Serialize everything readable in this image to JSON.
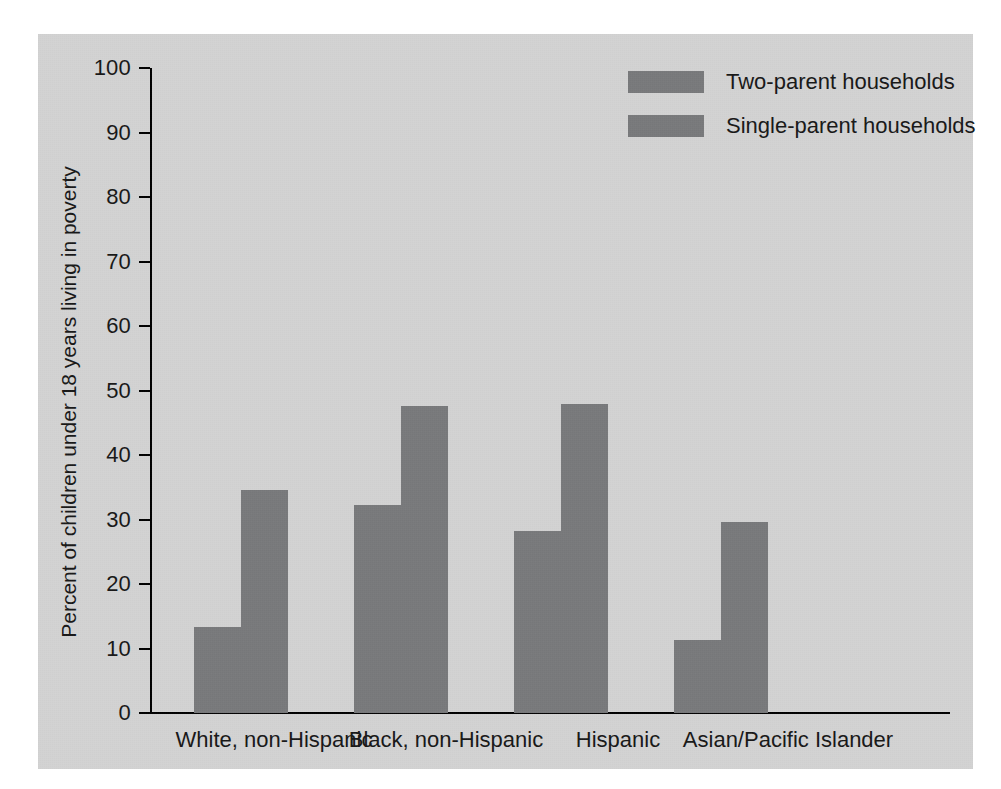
{
  "figure": {
    "background_color": "#d3d3d3",
    "bar_color": "#78797b",
    "axis_color": "#000000"
  },
  "axis": {
    "y_title": "Percent of children under 18 years living in poverty",
    "y_ticks": [
      "100",
      "90",
      "80",
      "70",
      "60",
      "50",
      "40",
      "30",
      "20",
      "10",
      "0"
    ]
  },
  "legend": {
    "items": [
      {
        "label": "Two-parent households",
        "color": "#78797b"
      },
      {
        "label": "Single-parent households",
        "color": "#78797b"
      }
    ]
  },
  "chart_data": {
    "type": "bar",
    "title": "",
    "xlabel": "",
    "ylabel": "Percent of children under 18 years living in poverty",
    "ylim": [
      0,
      100
    ],
    "ytick_step": 10,
    "grid": false,
    "legend_position": "top-right",
    "categories": [
      "White, non-Hispanic",
      "Black, non-Hispanic",
      "Hispanic",
      "Asian/Pacific Islander"
    ],
    "series": [
      {
        "name": "Two-parent households",
        "color": "#78797b",
        "values": [
          13.4,
          32.3,
          28.2,
          11.3
        ]
      },
      {
        "name": "Single-parent households",
        "color": "#78797b",
        "values": [
          34.6,
          47.6,
          47.9,
          29.6
        ]
      }
    ]
  }
}
